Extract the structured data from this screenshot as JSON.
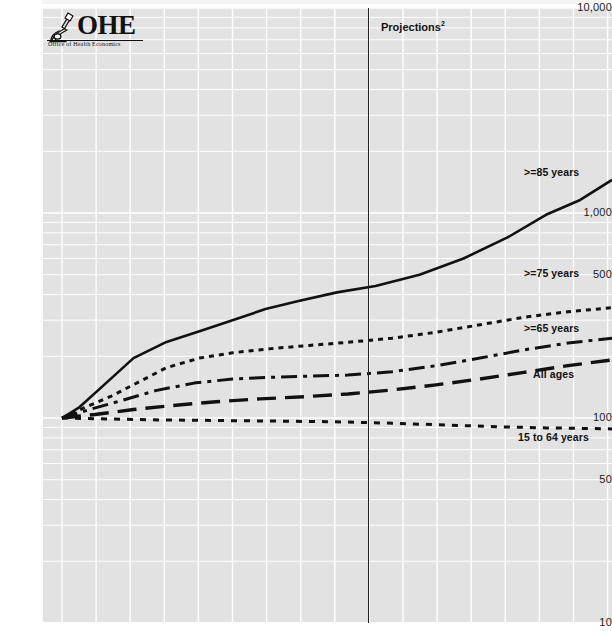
{
  "logo": {
    "name": "OHE",
    "text": "OHE",
    "tagline": "Office of Health Economics",
    "icon": "microscope-icon"
  },
  "annotations": {
    "projections_label": "Projections",
    "projections_superscript": "2",
    "projections_divider_x": 368
  },
  "chart_data": {
    "type": "line",
    "title": "",
    "xlabel": "",
    "ylabel": "",
    "yscale": "log",
    "ylim": [
      10,
      10000
    ],
    "grid": true,
    "legend_position": "inline-right",
    "ytick_labels": [
      "10,000",
      "1,000",
      "500",
      "100",
      "50",
      "10"
    ],
    "ytick_values": [
      10000,
      1000,
      500,
      100,
      50,
      10
    ],
    "xlim": [
      0,
      100
    ],
    "series": [
      {
        "name": ">=85 years",
        "label": ">=85 years",
        "style": "solid",
        "color": "#111111",
        "x": [
          0,
          3,
          8,
          13,
          19,
          25,
          31,
          37,
          43,
          50,
          57,
          65,
          73,
          81,
          88,
          94,
          100
        ],
        "values": [
          100,
          112,
          148,
          196,
          235,
          265,
          300,
          340,
          372,
          410,
          440,
          500,
          600,
          760,
          980,
          1150,
          1450
        ]
      },
      {
        "name": ">=75 years",
        "label": ">=75 years",
        "style": "dotted",
        "color": "#111111",
        "x": [
          0,
          4,
          9,
          14,
          19,
          25,
          31,
          38,
          45,
          52,
          60,
          68,
          76,
          84,
          92,
          100
        ],
        "values": [
          100,
          112,
          128,
          150,
          176,
          196,
          208,
          218,
          226,
          234,
          245,
          262,
          285,
          310,
          330,
          345
        ]
      },
      {
        "name": ">=65 years",
        "label": ">=65 years",
        "style": "dashdot",
        "color": "#111111",
        "x": [
          0,
          5,
          11,
          17,
          24,
          31,
          38,
          45,
          52,
          60,
          68,
          76,
          84,
          92,
          100
        ],
        "values": [
          100,
          110,
          122,
          136,
          148,
          155,
          158,
          160,
          162,
          168,
          180,
          196,
          215,
          232,
          245
        ]
      },
      {
        "name": "All ages",
        "label": "All ages",
        "style": "longdash",
        "color": "#111111",
        "x": [
          0,
          6,
          13,
          20,
          28,
          36,
          44,
          52,
          60,
          68,
          76,
          84,
          92,
          100
        ],
        "values": [
          100,
          104,
          110,
          115,
          120,
          124,
          127,
          131,
          137,
          145,
          155,
          167,
          180,
          192
        ]
      },
      {
        "name": "15 to 64 years",
        "label": "15 to 64 years",
        "style": "shortdash",
        "color": "#111111",
        "x": [
          0,
          8,
          16,
          24,
          32,
          40,
          48,
          56,
          64,
          72,
          80,
          88,
          94,
          100
        ],
        "values": [
          100,
          99,
          98,
          97.5,
          97,
          96.5,
          96,
          95,
          93.5,
          92,
          90.5,
          89.5,
          89,
          88.5
        ]
      }
    ]
  }
}
